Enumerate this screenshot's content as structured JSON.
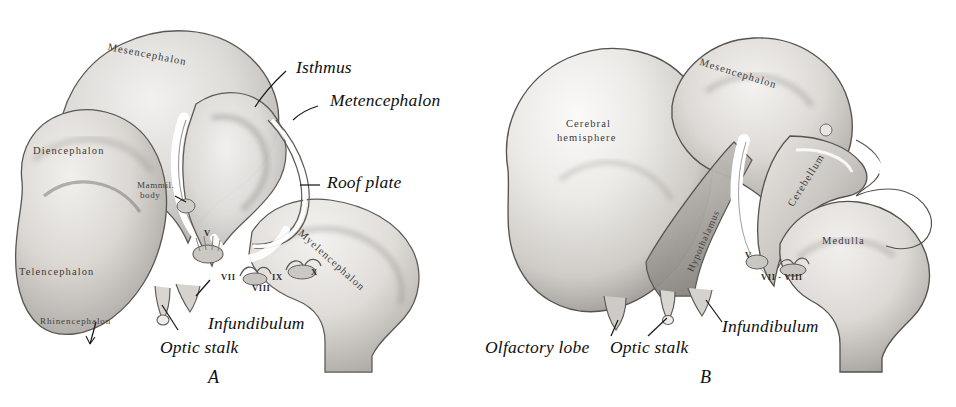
{
  "figure": {
    "width": 956,
    "height": 407,
    "background": "#ffffff",
    "ink": "#2e2e2e"
  },
  "panels": [
    {
      "id": "A",
      "caption": "A",
      "leader_labels": [
        {
          "name": "isthmus",
          "text": "Isthmus"
        },
        {
          "name": "metencephalon",
          "text": "Metencephalon"
        },
        {
          "name": "roof-plate",
          "text": "Roof plate"
        },
        {
          "name": "infundibulum",
          "text": "Infundibulum"
        },
        {
          "name": "optic-stalk",
          "text": "Optic stalk"
        }
      ],
      "inner_labels": [
        {
          "name": "mesencephalon",
          "text": "Mesencephalon"
        },
        {
          "name": "diencephalon",
          "text": "Diencephalon"
        },
        {
          "name": "telencephalon",
          "text": "Telencephalon"
        },
        {
          "name": "rhinencephalon",
          "text": "Rhinencephalon"
        },
        {
          "name": "myelencephalon",
          "text": "Myelencephalon"
        },
        {
          "name": "mammillary-body-line1",
          "text": "Mammil."
        },
        {
          "name": "mammillary-body-line2",
          "text": "body"
        }
      ],
      "cranial_nerves": [
        "V",
        "VII",
        "VIII",
        "IX",
        "X"
      ]
    },
    {
      "id": "B",
      "caption": "B",
      "leader_labels": [
        {
          "name": "infundibulum",
          "text": "Infundibulum"
        },
        {
          "name": "optic-stalk",
          "text": "Optic stalk"
        },
        {
          "name": "olfactory-lobe",
          "text": "Olfactory lobe"
        }
      ],
      "inner_labels": [
        {
          "name": "mesencephalon",
          "text": "Mesencephalon"
        },
        {
          "name": "cerebral-hemisphere-line1",
          "text": "Cerebral"
        },
        {
          "name": "cerebral-hemisphere-line2",
          "text": "hemisphere"
        },
        {
          "name": "cerebellum",
          "text": "Cerebellum"
        },
        {
          "name": "medulla",
          "text": "Medulla"
        },
        {
          "name": "hypothalamus",
          "text": "Hypothalamus"
        }
      ],
      "cranial_nerves": [
        "V",
        "VII - VIII"
      ]
    }
  ]
}
